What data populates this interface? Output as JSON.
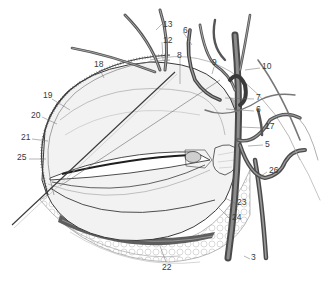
{
  "figure": {
    "type": "anatomical-illustration",
    "colors": {
      "background": "#ffffff",
      "line": "#3a3a3a",
      "vessel": "#6e6e6e",
      "vessel_dark": "#4a4a4a",
      "shade": "#bdbdbd",
      "label": "#3a3a3a"
    }
  },
  "labels": [
    {
      "id": "l13",
      "text": "13",
      "x": 163,
      "y": 20
    },
    {
      "id": "l12",
      "text": "12",
      "x": 163,
      "y": 38
    },
    {
      "id": "l6a",
      "text": "6",
      "x": 184,
      "y": 28
    },
    {
      "id": "l8",
      "text": "8",
      "x": 177,
      "y": 53
    },
    {
      "id": "l9",
      "text": "9",
      "x": 212,
      "y": 60
    },
    {
      "id": "l10",
      "text": "10",
      "x": 262,
      "y": 64
    },
    {
      "id": "l18",
      "text": "18",
      "x": 94,
      "y": 62
    },
    {
      "id": "l7",
      "text": "7",
      "x": 256,
      "y": 95
    },
    {
      "id": "l6b",
      "text": "6",
      "x": 256,
      "y": 107
    },
    {
      "id": "l17",
      "text": "17",
      "x": 265,
      "y": 124
    },
    {
      "id": "l5",
      "text": "5",
      "x": 265,
      "y": 142
    },
    {
      "id": "l19",
      "text": "19",
      "x": 43,
      "y": 93
    },
    {
      "id": "l20",
      "text": "20",
      "x": 31,
      "y": 113
    },
    {
      "id": "l21",
      "text": "21",
      "x": 21,
      "y": 135
    },
    {
      "id": "l25",
      "text": "25",
      "x": 17,
      "y": 155
    },
    {
      "id": "l26",
      "text": "26",
      "x": 269,
      "y": 168
    },
    {
      "id": "l23",
      "text": "23",
      "x": 237,
      "y": 200
    },
    {
      "id": "l24",
      "text": "24",
      "x": 232,
      "y": 215
    },
    {
      "id": "l22",
      "text": "22",
      "x": 162,
      "y": 265
    },
    {
      "id": "l3",
      "text": "3",
      "x": 251,
      "y": 255
    }
  ]
}
